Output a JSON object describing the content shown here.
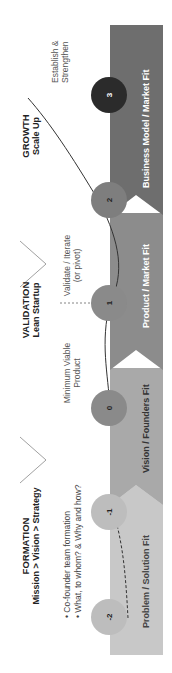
{
  "stages": [
    {
      "title": "FORMATION",
      "subtitle": "Mission > Vision > Strategy",
      "bullets": [
        "Co-founder team formation",
        "What, to whom? & Why and how?"
      ]
    },
    {
      "title": "VALIDATION",
      "subtitle": "Lean Startup",
      "notes": [
        {
          "text": "Minimum Viable",
          "text2": "Product"
        },
        {
          "text": "Validate / Iterate",
          "text2": "(or pivot)"
        }
      ]
    },
    {
      "title": "GROWTH",
      "subtitle": "Scale Up",
      "notes": [
        {
          "text": "Establish &",
          "text2": "Strengthen"
        }
      ]
    }
  ],
  "bands": [
    {
      "label": "Problem / Solution Fit",
      "color": "#c8c8c8"
    },
    {
      "label": "Vision / Founders Fit",
      "color": "#a9a9a9"
    },
    {
      "label": "Product / Market Fit",
      "color": "#8c8c8c"
    },
    {
      "label": "Business Model / Market Fit",
      "color": "#6e6e6e"
    }
  ],
  "nodes": [
    {
      "label": "-2",
      "color": "#bdbdbd"
    },
    {
      "label": "-1",
      "color": "#bdbdbd"
    },
    {
      "label": "0",
      "color": "#8a8a8a"
    },
    {
      "label": "1",
      "color": "#8a8a8a"
    },
    {
      "label": "2",
      "color": "#8a8a8a"
    },
    {
      "label": "3",
      "color": "#2b2b2b",
      "text_color": "#ffffff"
    }
  ]
}
